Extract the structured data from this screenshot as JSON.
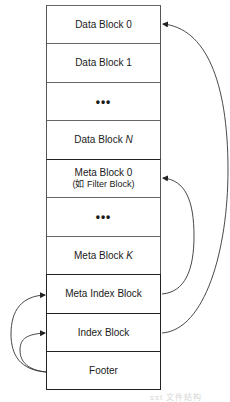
{
  "diagram": {
    "blocks": [
      {
        "label": "Data Block 0"
      },
      {
        "label": "Data Block 1"
      },
      {
        "label": "..."
      },
      {
        "label": "Data Block",
        "italic_suffix": "N"
      },
      {
        "label": "Meta Block 0",
        "sublabel": "(如 Filter Block)"
      },
      {
        "label": "..."
      },
      {
        "label": "Meta Block",
        "italic_suffix": "K"
      },
      {
        "label": "Meta Index Block"
      },
      {
        "label": "Index Block"
      },
      {
        "label": "Footer"
      }
    ],
    "arrows": [
      {
        "from": "Index Block",
        "to": "Data Block 0",
        "side": "right"
      },
      {
        "from": "Meta Index Block",
        "to": "Meta Block 0",
        "side": "right"
      },
      {
        "from": "Footer",
        "to": "Meta Index Block",
        "side": "left"
      },
      {
        "from": "Footer",
        "to": "Index Block",
        "side": "left"
      }
    ],
    "caption": "sst 文件结构"
  }
}
